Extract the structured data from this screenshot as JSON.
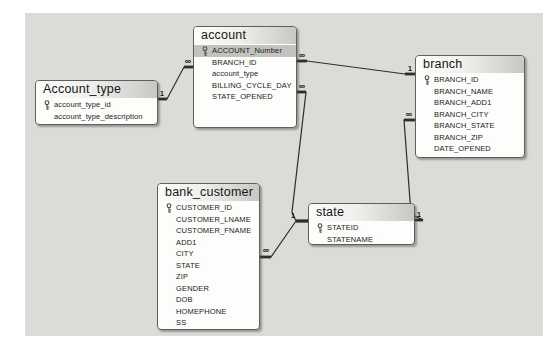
{
  "diagram": {
    "canvas": {
      "width": 550,
      "height": 348
    },
    "colors": {
      "page_background": "#ffffff",
      "panel_background": "#dbdbd7",
      "table_background": "#fdfdfc",
      "table_border": "#5f5f5c",
      "header_gradient_end": "#c7c7c4",
      "highlight_row": "#c2c2bf",
      "line_color": "#2e2e2e",
      "key_icon_color": "#4a4a4a"
    },
    "tables": [
      {
        "name": "account",
        "x": 193,
        "y": 26,
        "w": 104,
        "h": 102,
        "fields": [
          {
            "name": "ACCOUNT_Number",
            "pk": true,
            "highlighted": true
          },
          {
            "name": "BRANCH_ID",
            "pk": false,
            "highlighted": false
          },
          {
            "name": "account_type",
            "pk": false,
            "highlighted": false
          },
          {
            "name": "BILLING_CYCLE_DAY",
            "pk": false,
            "highlighted": false
          },
          {
            "name": "STATE_OPENED",
            "pk": false,
            "highlighted": false
          }
        ]
      },
      {
        "name": "Account_type",
        "x": 35,
        "y": 80,
        "w": 123,
        "h": 45,
        "fields": [
          {
            "name": "account_type_id",
            "pk": true,
            "highlighted": false
          },
          {
            "name": "account_type_description",
            "pk": false,
            "highlighted": false
          }
        ]
      },
      {
        "name": "branch",
        "x": 415,
        "y": 55,
        "w": 110,
        "h": 103,
        "fields": [
          {
            "name": "BRANCH_ID",
            "pk": true,
            "highlighted": false
          },
          {
            "name": "BRANCH_NAME",
            "pk": false,
            "highlighted": false
          },
          {
            "name": "BRANCH_ADD1",
            "pk": false,
            "highlighted": false
          },
          {
            "name": "BRANCH_CITY",
            "pk": false,
            "highlighted": false
          },
          {
            "name": "BRANCH_STATE",
            "pk": false,
            "highlighted": false
          },
          {
            "name": "BRANCH_ZIP",
            "pk": false,
            "highlighted": false
          },
          {
            "name": "DATE_OPENED",
            "pk": false,
            "highlighted": false
          }
        ]
      },
      {
        "name": "bank_customer",
        "x": 157,
        "y": 183,
        "w": 103,
        "h": 147,
        "fields": [
          {
            "name": "CUSTOMER_ID",
            "pk": true,
            "highlighted": false
          },
          {
            "name": "CUSTOMER_LNAME",
            "pk": false,
            "highlighted": false
          },
          {
            "name": "CUSTOMER_FNAME",
            "pk": false,
            "highlighted": false
          },
          {
            "name": "ADD1",
            "pk": false,
            "highlighted": false
          },
          {
            "name": "CITY",
            "pk": false,
            "highlighted": false
          },
          {
            "name": "STATE",
            "pk": false,
            "highlighted": false
          },
          {
            "name": "ZIP",
            "pk": false,
            "highlighted": false
          },
          {
            "name": "GENDER",
            "pk": false,
            "highlighted": false
          },
          {
            "name": "DOB",
            "pk": false,
            "highlighted": false
          },
          {
            "name": "HOMEPHONE",
            "pk": false,
            "highlighted": false
          },
          {
            "name": "SS",
            "pk": false,
            "highlighted": false
          }
        ]
      },
      {
        "name": "state",
        "x": 308,
        "y": 203,
        "w": 107,
        "h": 42,
        "fields": [
          {
            "name": "STATEID",
            "pk": true,
            "highlighted": false
          },
          {
            "name": "STATENAME",
            "pk": false,
            "highlighted": false
          }
        ]
      }
    ],
    "relationships": [
      {
        "id": "Account_type-account",
        "one_side": "Account_type",
        "many_side": "account",
        "points": [
          [
            158,
            99
          ],
          [
            167,
            99
          ],
          [
            184,
            67
          ],
          [
            193,
            67
          ]
        ],
        "labels": [
          {
            "text": "1",
            "x": 162,
            "y": 96,
            "size": 7
          },
          {
            "text": "∞",
            "x": 188,
            "y": 64,
            "size": 9
          }
        ]
      },
      {
        "id": "branch-account",
        "one_side": "branch",
        "many_side": "account",
        "points": [
          [
            297,
            61
          ],
          [
            307,
            61
          ],
          [
            405,
            74
          ],
          [
            415,
            74
          ]
        ],
        "labels": [
          {
            "text": "∞",
            "x": 302,
            "y": 58,
            "size": 9
          },
          {
            "text": "1",
            "x": 410,
            "y": 71,
            "size": 7
          }
        ]
      },
      {
        "id": "state-account",
        "one_side": "state",
        "many_side": "account",
        "points": [
          [
            297,
            92
          ],
          [
            306,
            92
          ],
          [
            292,
            212
          ],
          [
            296,
            221
          ],
          [
            308,
            221
          ]
        ],
        "labels": [
          {
            "text": "∞",
            "x": 302,
            "y": 89,
            "size": 9
          },
          {
            "text": "1",
            "x": 293,
            "y": 218,
            "size": 7
          }
        ]
      },
      {
        "id": "state-bank_customer",
        "one_side": "state",
        "many_side": "bank_customer",
        "points": [
          [
            260,
            257
          ],
          [
            271,
            257
          ],
          [
            296,
            221
          ],
          [
            308,
            221
          ]
        ],
        "labels": [
          {
            "text": "∞",
            "x": 266,
            "y": 253,
            "size": 9
          }
        ]
      },
      {
        "id": "state-branch",
        "one_side": "state",
        "many_side": "branch",
        "points": [
          [
            415,
            120
          ],
          [
            404,
            120
          ],
          [
            411,
            214
          ],
          [
            423,
            220
          ],
          [
            415,
            220
          ]
        ],
        "labels": [
          {
            "text": "∞",
            "x": 409,
            "y": 117,
            "size": 9
          },
          {
            "text": "1",
            "x": 419,
            "y": 217,
            "size": 7
          }
        ]
      }
    ]
  }
}
